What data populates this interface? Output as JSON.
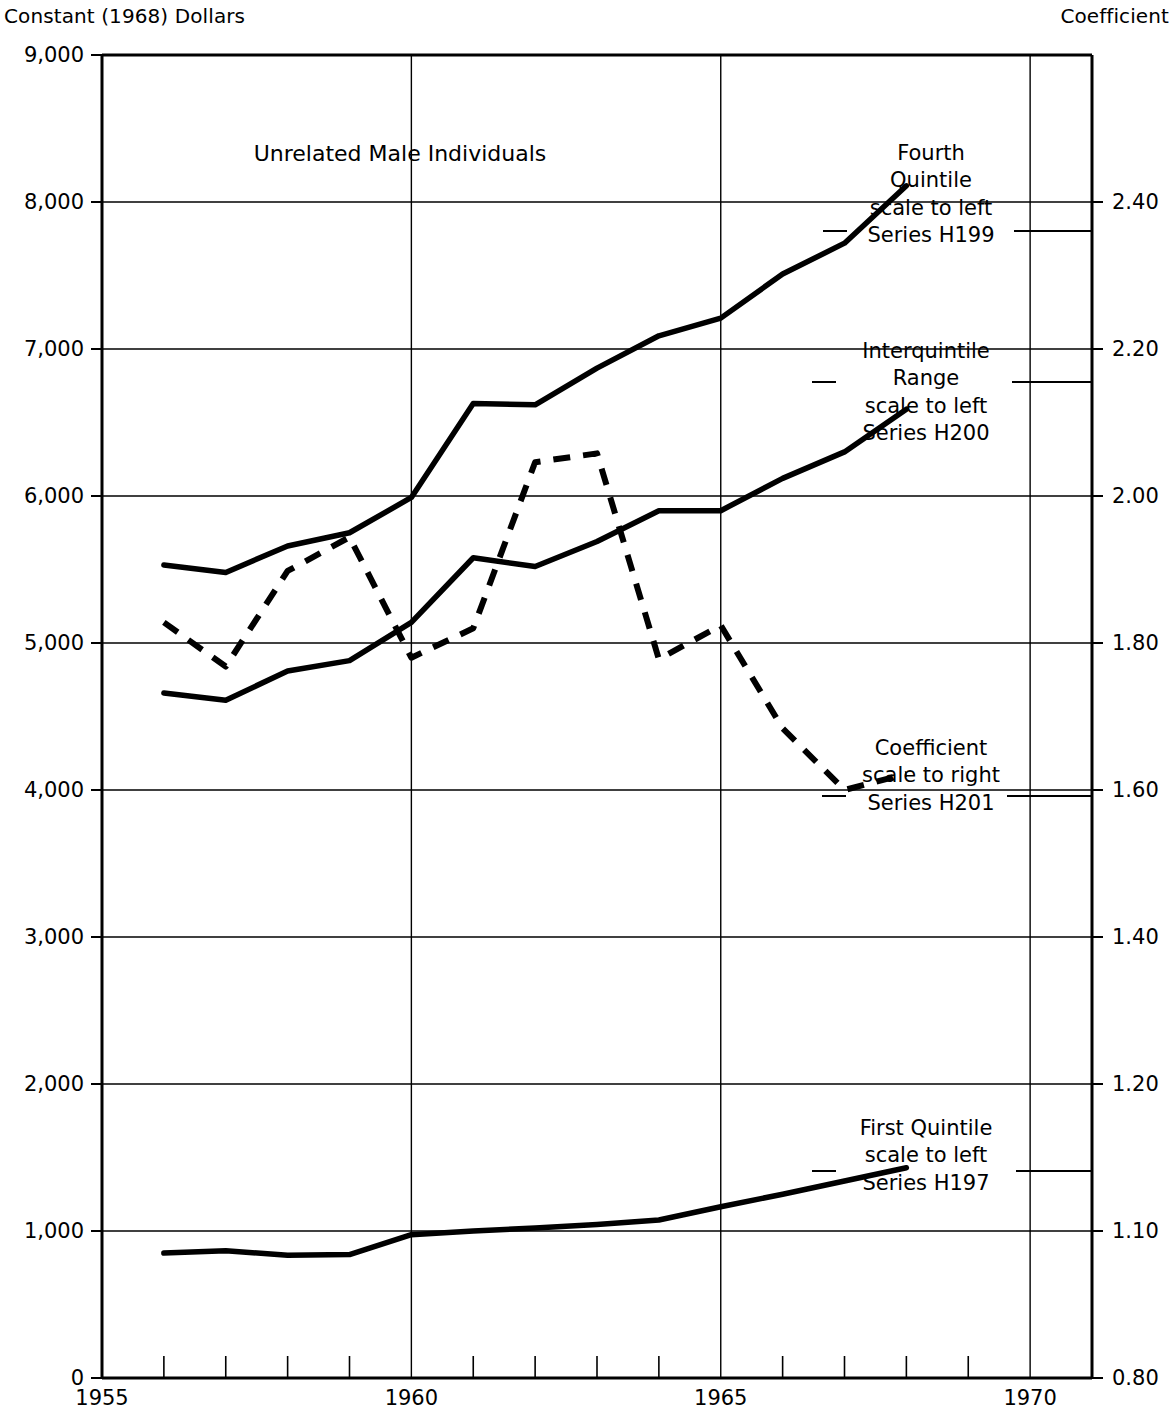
{
  "header": {
    "left_title": "Constant (1968) Dollars",
    "right_title": "Coefficient"
  },
  "chart_data": {
    "type": "line",
    "title": "Unrelated Male Individuals",
    "subtitle": "",
    "xlabel": "",
    "ylabel": "Constant (1968) Dollars",
    "y2label": "Coefficient",
    "xlim": [
      1955,
      1971
    ],
    "ylim": [
      0,
      9000
    ],
    "y2lim": [
      0.8,
      2.6
    ],
    "grid": true,
    "legend_position": "inline-annotations",
    "x_ticks": [
      1955,
      1956,
      1957,
      1958,
      1959,
      1960,
      1961,
      1962,
      1963,
      1964,
      1965,
      1966,
      1967,
      1968,
      1969,
      1970,
      1971
    ],
    "x_tick_labels": [
      "1955",
      "",
      "",
      "",
      "",
      "1960",
      "",
      "",
      "",
      "",
      "1965",
      "",
      "",
      "",
      "",
      "1970",
      ""
    ],
    "x_major_ticks": [
      1955,
      1960,
      1965,
      1970
    ],
    "y_left_ticks": [
      0,
      1000,
      2000,
      3000,
      4000,
      5000,
      6000,
      7000,
      8000,
      9000
    ],
    "y_left_tick_labels": [
      "0",
      "1,000",
      "2,000",
      "3,000",
      "4,000",
      "5,000",
      "6,000",
      "7,000",
      "8,000",
      "9,000"
    ],
    "y_right_tick_labels": [
      "2.40",
      "2.20",
      "2.00",
      "1.80",
      "1.60",
      "1.40",
      "1.20",
      "1.10",
      "0.80"
    ],
    "y_right_tick_values": [
      2.4,
      2.2,
      2.0,
      1.8,
      1.6,
      1.4,
      1.2,
      1.1,
      0.8
    ],
    "y_right_tick_left_equivalent": [
      8000,
      7000,
      6000,
      5000,
      4000,
      3000,
      2000,
      1000,
      0
    ],
    "x": [
      1956,
      1957,
      1958,
      1959,
      1960,
      1961,
      1962,
      1963,
      1964,
      1965,
      1966,
      1967,
      1968
    ],
    "series": [
      {
        "name": "Fourth Quintile",
        "code": "H199",
        "scale": "left",
        "style": "solid",
        "values": [
          5530,
          5480,
          5660,
          5750,
          5990,
          6630,
          6620,
          6870,
          7090,
          7210,
          7510,
          7720,
          8110
        ]
      },
      {
        "name": "Interquintile Range",
        "code": "H200",
        "scale": "left",
        "style": "solid",
        "values": [
          4660,
          4610,
          4810,
          4880,
          5140,
          5580,
          5520,
          5690,
          5900,
          5900,
          6120,
          6300,
          6590
        ]
      },
      {
        "name": "Coefficient",
        "code": "H201",
        "scale": "right",
        "style": "dashed",
        "values": [
          1.83,
          1.77,
          1.9,
          1.94,
          1.79,
          1.82,
          2.05,
          2.07,
          1.79,
          1.84,
          1.72,
          1.6,
          1.62
        ],
        "values_as_left_equivalent": [
          5140,
          4840,
          5490,
          5720,
          4900,
          5100,
          6230,
          6290,
          4890,
          5120,
          4420,
          4000,
          4110
        ]
      }
    ],
    "annotations": [
      {
        "id": "fourth-quintile",
        "lines": [
          "Fourth",
          "Quintile",
          "scale to left",
          "Series H199"
        ]
      },
      {
        "id": "interquintile-range",
        "lines": [
          "Interquintile",
          "Range",
          "scale to left",
          "Series H200"
        ]
      },
      {
        "id": "coefficient",
        "lines": [
          "Coefficient",
          "scale to right",
          "Series H201"
        ]
      },
      {
        "id": "first-quintile",
        "lines": [
          "First Quintile",
          "scale to left",
          "Series H197"
        ]
      }
    ],
    "first_quintile": {
      "name": "First Quintile",
      "code": "H197",
      "scale": "left",
      "style": "solid",
      "x": [
        1956,
        1957,
        1958,
        1959,
        1960,
        1961,
        1962,
        1963,
        1964,
        1965,
        1966,
        1967,
        1968
      ],
      "values": [
        850,
        865,
        835,
        840,
        975,
        1000,
        1020,
        1045,
        1075,
        1165,
        1250,
        1340,
        1430
      ]
    },
    "colors": {
      "line": "#000000",
      "grid": "#000000",
      "background": "#ffffff"
    }
  }
}
